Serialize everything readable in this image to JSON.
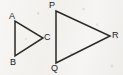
{
  "figure": {
    "background_color": "#f4f3f1",
    "stroke_color": "#2b2926",
    "label_color": "#23211f",
    "canvas": {
      "width": 123,
      "height": 75
    }
  },
  "shapes": [
    {
      "name": "triangle-abc",
      "kind": "triangle",
      "orientation": "points-right",
      "points": "15,21 15,56 43,38",
      "vertices": [
        {
          "label": "A",
          "x": 15,
          "y": 21
        },
        {
          "label": "B",
          "x": 15,
          "y": 56
        },
        {
          "label": "C",
          "x": 43,
          "y": 38
        }
      ]
    },
    {
      "name": "triangle-pqr",
      "kind": "triangle",
      "orientation": "points-right",
      "points": "56,11 56,63 110,36",
      "vertices": [
        {
          "label": "P",
          "x": 56,
          "y": 11
        },
        {
          "label": "Q",
          "x": 56,
          "y": 63
        },
        {
          "label": "R",
          "x": 110,
          "y": 36
        }
      ]
    }
  ],
  "labels": {
    "a": "A",
    "b": "B",
    "c": "C",
    "p": "P",
    "q": "Q",
    "r": "R"
  }
}
